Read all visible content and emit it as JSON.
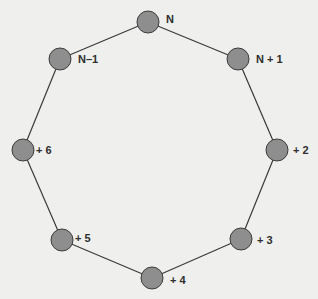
{
  "diagram": {
    "type": "ring",
    "colors": {
      "background": "#efefed",
      "node_fill": "#8e8e8e",
      "node_stroke": "#3c3c3c",
      "edge": "#3a3a3a",
      "label": "#2e2e2e"
    },
    "nodes": [
      {
        "id": "n",
        "label": "N",
        "cx": 148,
        "cy": 22
      },
      {
        "id": "n_plus_1",
        "label": "N + 1",
        "cx": 238,
        "cy": 59
      },
      {
        "id": "plus_2",
        "label": "+ 2",
        "cx": 277,
        "cy": 150
      },
      {
        "id": "plus_3",
        "label": "+ 3",
        "cx": 241,
        "cy": 239
      },
      {
        "id": "plus_4",
        "label": "+ 4",
        "cx": 152,
        "cy": 278
      },
      {
        "id": "plus_5",
        "label": "+ 5",
        "cx": 62,
        "cy": 240
      },
      {
        "id": "plus_6",
        "label": "+ 6",
        "cx": 23,
        "cy": 150
      },
      {
        "id": "n_minus_1",
        "label": "N–1",
        "cx": 60,
        "cy": 59
      }
    ],
    "edges": [
      [
        "n",
        "n_plus_1"
      ],
      [
        "n_plus_1",
        "plus_2"
      ],
      [
        "plus_2",
        "plus_3"
      ],
      [
        "plus_3",
        "plus_4"
      ],
      [
        "plus_4",
        "plus_5"
      ],
      [
        "plus_5",
        "plus_6"
      ],
      [
        "plus_6",
        "n_minus_1"
      ],
      [
        "n_minus_1",
        "n"
      ]
    ]
  }
}
